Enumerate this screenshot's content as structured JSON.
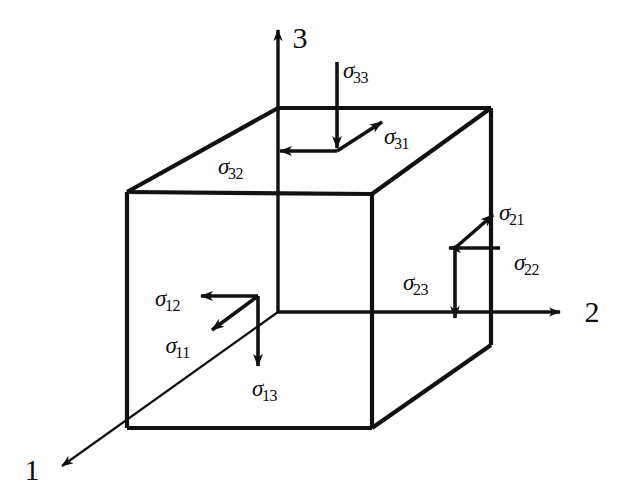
{
  "figure": {
    "type": "stress-cube-diagram",
    "background_color": "#ffffff",
    "line_color": "#111111",
    "axes": [
      {
        "id": "axis-1",
        "label": "1",
        "direction": "down-left",
        "x": 32,
        "y": 470
      },
      {
        "id": "axis-2",
        "label": "2",
        "direction": "right",
        "x": 592,
        "y": 312
      },
      {
        "id": "axis-3",
        "label": "3",
        "direction": "up",
        "x": 300,
        "y": 38
      }
    ],
    "stress_labels": [
      {
        "id": "sigma-33",
        "symbol": "σ",
        "subscript": "33",
        "face": "top",
        "arrow": "down",
        "x": 356,
        "y": 70
      },
      {
        "id": "sigma-31",
        "symbol": "σ",
        "subscript": "31",
        "face": "top",
        "arrow": "up-right",
        "x": 397,
        "y": 136
      },
      {
        "id": "sigma-32",
        "symbol": "σ",
        "subscript": "32",
        "face": "top",
        "arrow": "left",
        "x": 231,
        "y": 166
      },
      {
        "id": "sigma-21",
        "symbol": "σ",
        "subscript": "21",
        "face": "right",
        "arrow": "up-right",
        "x": 512,
        "y": 212
      },
      {
        "id": "sigma-22",
        "symbol": "σ",
        "subscript": "22",
        "face": "right",
        "arrow": "left",
        "x": 527,
        "y": 262
      },
      {
        "id": "sigma-23",
        "symbol": "σ",
        "subscript": "23",
        "face": "right",
        "arrow": "down",
        "x": 416,
        "y": 282
      },
      {
        "id": "sigma-12",
        "symbol": "σ",
        "subscript": "12",
        "face": "front",
        "arrow": "left",
        "x": 168,
        "y": 298
      },
      {
        "id": "sigma-11",
        "symbol": "σ",
        "subscript": "11",
        "face": "front",
        "arrow": "down-left",
        "x": 178,
        "y": 345
      },
      {
        "id": "sigma-13",
        "symbol": "σ",
        "subscript": "13",
        "face": "front",
        "arrow": "down",
        "x": 265,
        "y": 388
      }
    ]
  }
}
